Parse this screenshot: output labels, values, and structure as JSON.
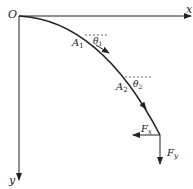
{
  "diagram": {
    "origin_label": "O",
    "x_axis_label": "x",
    "y_axis_label": "y",
    "points": [
      {
        "label_main": "A",
        "label_sub": "1"
      },
      {
        "label_main": "A",
        "label_sub": "2"
      }
    ],
    "angles": [
      {
        "label_main": "θ",
        "label_sub": "1"
      },
      {
        "label_main": "θ",
        "label_sub": "2"
      }
    ],
    "forces": [
      {
        "label_main": "F",
        "label_sub": "x"
      },
      {
        "label_main": "F",
        "label_sub": "y"
      }
    ],
    "colors": {
      "ink": "#222222",
      "background": "#ffffff"
    }
  }
}
